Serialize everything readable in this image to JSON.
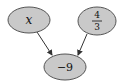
{
  "diagram": {
    "type": "expression-graph",
    "nodes": [
      {
        "id": "x",
        "label": "x",
        "kind": "variable"
      },
      {
        "id": "frac",
        "label": "4/3",
        "numerator": "4",
        "denominator": "3",
        "kind": "constant"
      },
      {
        "id": "result",
        "label": "−9",
        "kind": "result"
      }
    ],
    "edges": [
      {
        "from": "x",
        "to": "result"
      },
      {
        "from": "frac",
        "to": "result"
      }
    ],
    "colors": {
      "node_fill": "#c9c9c9",
      "node_stroke": "#555555",
      "edge": "#333333",
      "background": "#ffffff"
    }
  }
}
